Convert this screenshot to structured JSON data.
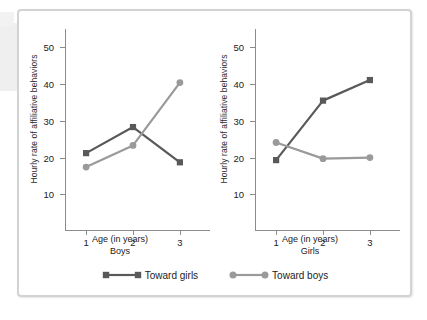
{
  "figure": {
    "legend": [
      {
        "label": "Toward girls",
        "marker": "square",
        "color": "#595959"
      },
      {
        "label": "Toward boys",
        "marker": "circle",
        "color": "#9a9a9a"
      }
    ]
  },
  "colors": {
    "toward_girls": "#595959",
    "toward_boys": "#9a9a9a",
    "axis": "#8c8c8c",
    "frame": "#d3d3d3",
    "text": "#222222"
  },
  "chart_data": [
    {
      "type": "line",
      "title": "Boys",
      "xlabel": "Age (in years)",
      "group_label": "Boys",
      "ylabel": "Hourly rate of affiliative behaviors",
      "categories": [
        "1",
        "2",
        "3"
      ],
      "x": [
        1,
        2,
        3
      ],
      "xlim": [
        0.55,
        3.45
      ],
      "ylim": [
        0,
        55
      ],
      "yticks": [
        10,
        20,
        30,
        40,
        50
      ],
      "xticks": [
        "1",
        "2",
        "3"
      ],
      "grid": false,
      "legend_position": "bottom",
      "series": [
        {
          "name": "Toward girls",
          "marker": "square",
          "color": "#595959",
          "values": [
            21.2,
            28.3,
            18.7
          ]
        },
        {
          "name": "Toward boys",
          "marker": "circle",
          "color": "#9a9a9a",
          "values": [
            17.4,
            23.3,
            40.4
          ]
        }
      ]
    },
    {
      "type": "line",
      "title": "Girls",
      "xlabel": "Age (in years)",
      "group_label": "Girls",
      "ylabel": "Hourly rate of affiliative behaviors",
      "categories": [
        "1",
        "2",
        "3"
      ],
      "x": [
        1,
        2,
        3
      ],
      "xlim": [
        0.55,
        3.45
      ],
      "ylim": [
        0,
        55
      ],
      "yticks": [
        10,
        20,
        30,
        40,
        50
      ],
      "xticks": [
        "1",
        "2",
        "3"
      ],
      "grid": false,
      "legend_position": "bottom",
      "series": [
        {
          "name": "Toward girls",
          "marker": "square",
          "color": "#595959",
          "values": [
            19.3,
            35.5,
            41.1
          ]
        },
        {
          "name": "Toward boys",
          "marker": "circle",
          "color": "#9a9a9a",
          "values": [
            24.1,
            19.7,
            20.0
          ]
        }
      ]
    }
  ]
}
